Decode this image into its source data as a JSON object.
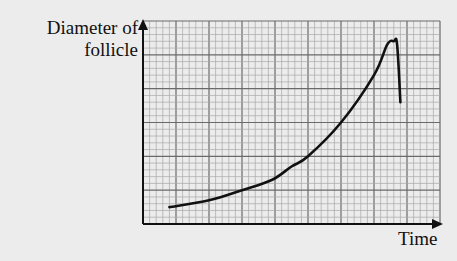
{
  "chart_data": {
    "type": "line",
    "title": "",
    "xlabel": "Time",
    "ylabel_lines": [
      "Diameter of",
      "follicle"
    ],
    "ylabel": "Diameter of follicle",
    "x_ticks": [],
    "y_ticks": [],
    "grid": true,
    "grid_major_cells": {
      "x": 9,
      "y": 6
    },
    "grid_minor_per_major": 5,
    "xlim": [
      0,
      9
    ],
    "ylim": [
      0,
      6
    ],
    "series": [
      {
        "name": "Follicle diameter",
        "x": [
          0.8,
          2.0,
          3.0,
          3.9,
          4.5,
          5.0,
          6.0,
          7.0,
          7.4,
          7.6,
          7.7,
          7.8
        ],
        "y": [
          0.5,
          0.7,
          1.0,
          1.3,
          1.7,
          2.0,
          3.0,
          4.4,
          5.3,
          5.4,
          5.3,
          3.6
        ]
      }
    ],
    "annotations": []
  },
  "axis": {
    "x_label": "Time",
    "y_label_line1": "Diameter of",
    "y_label_line2": "follicle"
  }
}
